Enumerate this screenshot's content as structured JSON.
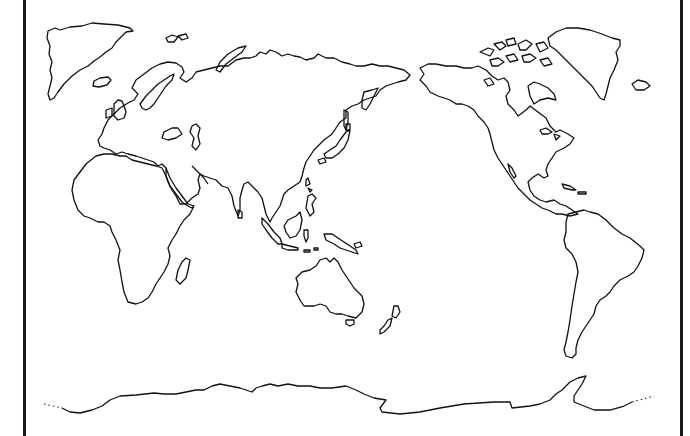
{
  "map": {
    "type": "blank world outline map",
    "projection": "Pacific-centered",
    "colors": {
      "background": "#ffffff",
      "outline": "#111111",
      "border": "#1a1a1a"
    },
    "landmasses": [
      {
        "id": "greenland-west",
        "label": "Greenland"
      },
      {
        "id": "iceland-west",
        "label": "Iceland"
      },
      {
        "id": "europe",
        "label": "Europe"
      },
      {
        "id": "british-isles",
        "label": "British Isles"
      },
      {
        "id": "scandinavia",
        "label": "Scandinavia"
      },
      {
        "id": "africa",
        "label": "Africa"
      },
      {
        "id": "madagascar",
        "label": "Madagascar"
      },
      {
        "id": "arabia",
        "label": "Arabian Peninsula"
      },
      {
        "id": "india",
        "label": "India"
      },
      {
        "id": "sri-lanka",
        "label": "Sri Lanka"
      },
      {
        "id": "asia",
        "label": "Asia"
      },
      {
        "id": "novaya-zemlya",
        "label": "Novaya Zemlya"
      },
      {
        "id": "kamchatka",
        "label": "Kamchatka"
      },
      {
        "id": "sakhalin",
        "label": "Sakhalin"
      },
      {
        "id": "japan",
        "label": "Japan"
      },
      {
        "id": "taiwan",
        "label": "Taiwan"
      },
      {
        "id": "philippines",
        "label": "Philippines"
      },
      {
        "id": "borneo",
        "label": "Borneo"
      },
      {
        "id": "sumatra",
        "label": "Sumatra"
      },
      {
        "id": "java",
        "label": "Java"
      },
      {
        "id": "new-guinea",
        "label": "New Guinea"
      },
      {
        "id": "australia",
        "label": "Australia"
      },
      {
        "id": "tasmania",
        "label": "Tasmania"
      },
      {
        "id": "new-zealand",
        "label": "New Zealand"
      },
      {
        "id": "north-america",
        "label": "North America"
      },
      {
        "id": "arctic-archipelago",
        "label": "Canadian Arctic Archipelago"
      },
      {
        "id": "greenland-east",
        "label": "Greenland"
      },
      {
        "id": "iceland-east",
        "label": "Iceland"
      },
      {
        "id": "cuba",
        "label": "Cuba"
      },
      {
        "id": "south-america",
        "label": "South America"
      },
      {
        "id": "antarctica",
        "label": "Antarctica"
      }
    ]
  }
}
